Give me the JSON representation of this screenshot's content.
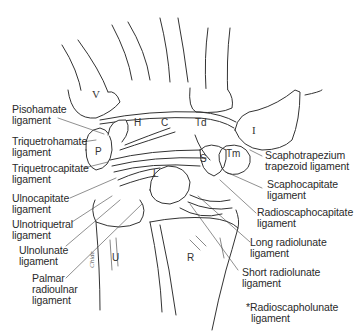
{
  "figure": {
    "bones": {
      "V": "V",
      "I": "I",
      "H": "H",
      "C": "C",
      "Td": "Td",
      "Tm": "Tm",
      "S": "S",
      "P": "P",
      "L": "L",
      "U": "U",
      "R": "R"
    },
    "labels": {
      "pisohamate": [
        "Pisohamate",
        "ligament"
      ],
      "triquetrohamate": [
        "Triquetrohamate",
        "ligament"
      ],
      "triquetrocapitate": [
        "Triquetrocapitate",
        "ligament"
      ],
      "ulnocapitate": [
        "Ulnocapitate",
        "ligament"
      ],
      "ulnotriquetral": [
        "Ulnotriquetral",
        "ligament"
      ],
      "ulnolunate": [
        "Ulnolunate",
        "ligament"
      ],
      "palmar_radioulnar": [
        "Palmar",
        "radioulnar",
        "ligament"
      ],
      "scaphotrapezium": [
        "Scaphotrapezium",
        "trapezoid ligament"
      ],
      "scaphocapitate": [
        "Scaphocapitate",
        "ligament"
      ],
      "radioscaphocapitate": [
        "Radioscaphocapitate",
        "ligament"
      ],
      "long_radiolunate": [
        "Long radiolunate",
        "ligament"
      ],
      "short_radiolunate": [
        "Short radiolunate",
        "ligament"
      ],
      "radioscapholunate": [
        "*Radioscapholunate",
        "ligament"
      ]
    },
    "signature": "Chide"
  }
}
